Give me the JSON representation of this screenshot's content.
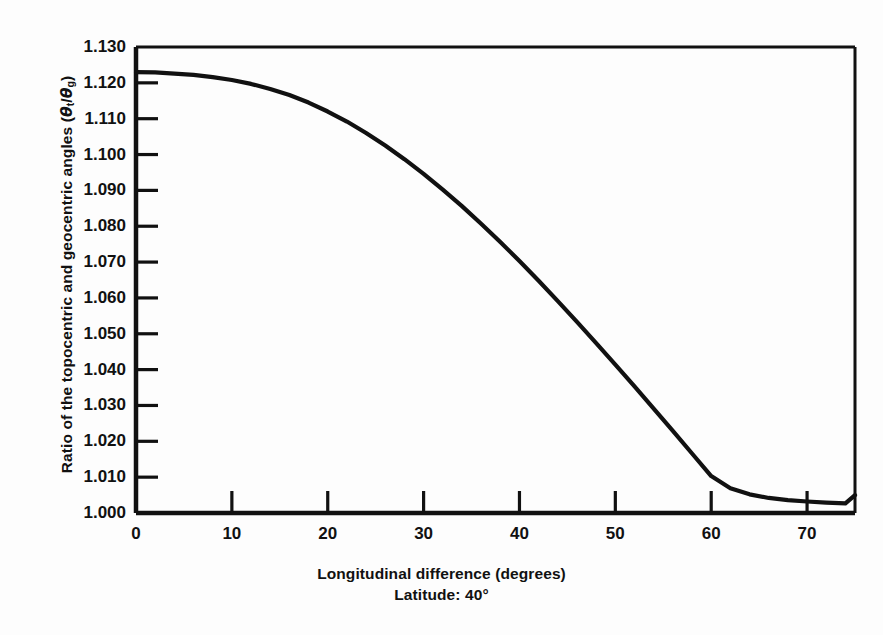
{
  "figure": {
    "background_color": "#fdfdfd",
    "line_color": "#111111",
    "axis_color": "#111111"
  },
  "captions": {
    "xlabel": "Longitudinal difference (degrees)",
    "condition": "Latitude: 40°"
  },
  "ylabel": {
    "prefix": "Ratio of the topocentric and geocentric angles (",
    "theta1": "θ",
    "sub1": "t",
    "slash": "/",
    "theta2": "θ",
    "sub2": "g",
    "suffix": ")"
  },
  "chart_data": {
    "type": "line",
    "title": "",
    "xlabel": "Longitudinal difference (degrees)",
    "ylabel": "Ratio of the topocentric and geocentric angles (θt/θg)",
    "annotation": "Latitude: 40°",
    "xlim": [
      0,
      75
    ],
    "ylim": [
      1.0,
      1.13
    ],
    "xticks": [
      0,
      10,
      20,
      30,
      40,
      50,
      60,
      70
    ],
    "xtick_labels": [
      "0",
      "10",
      "20",
      "30",
      "40",
      "50",
      "60",
      "70"
    ],
    "yticks": [
      1.0,
      1.01,
      1.02,
      1.03,
      1.04,
      1.05,
      1.06,
      1.07,
      1.08,
      1.09,
      1.1,
      1.11,
      1.12,
      1.13
    ],
    "ytick_labels": [
      "1.000",
      "1.010",
      "1.020",
      "1.030",
      "1.040",
      "1.050",
      "1.060",
      "1.070",
      "1.080",
      "1.090",
      "1.100",
      "1.110",
      "1.120",
      "1.130"
    ],
    "grid": false,
    "legend": null,
    "series": [
      {
        "name": "theta_t/theta_g at latitude 40 degrees",
        "x": [
          0,
          2,
          4,
          6,
          8,
          10,
          12,
          14,
          16,
          18,
          20,
          22,
          24,
          26,
          28,
          30,
          32,
          34,
          36,
          38,
          40,
          42,
          44,
          46,
          48,
          50,
          52,
          54,
          56,
          58,
          60,
          62,
          64,
          66,
          68,
          70,
          72,
          74,
          75
        ],
        "y": [
          1.123,
          1.1229,
          1.1226,
          1.1222,
          1.1216,
          1.1208,
          1.1197,
          1.1183,
          1.1166,
          1.1145,
          1.112,
          1.1092,
          1.106,
          1.1025,
          1.0987,
          1.0946,
          1.0902,
          1.0856,
          1.0807,
          1.0756,
          1.0703,
          1.0648,
          1.0591,
          1.0533,
          1.0474,
          1.0414,
          1.0353,
          1.0291,
          1.0229,
          1.0166,
          1.0103,
          1.0069,
          1.0052,
          1.0042,
          1.0036,
          1.0032,
          1.0029,
          1.0027,
          1.005
        ]
      }
    ]
  },
  "plot_geometry": {
    "left_px": 136,
    "right_px": 855,
    "top_px": 47,
    "bottom_px": 513
  }
}
